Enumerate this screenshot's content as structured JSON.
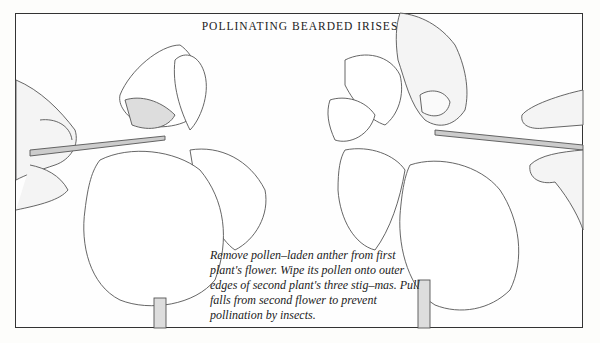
{
  "title": "POLLINATING BEARDED IRISES",
  "caption": "Remove pollen–laden anther from first plant's flower. Wipe its pollen onto outer edges of second plant's three stig–mas. Pull falls from second flower to prevent pollination by insects.",
  "illustrations": [
    {
      "label": "left-iris-with-tweezers-and-hands"
    },
    {
      "label": "right-iris-with-tweezers-and-hands"
    }
  ]
}
